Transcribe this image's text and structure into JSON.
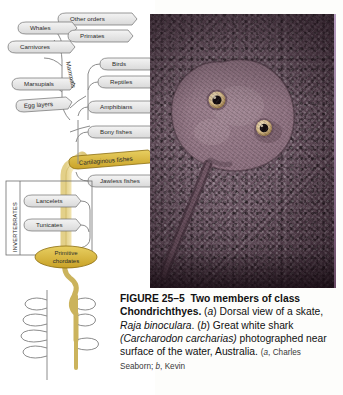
{
  "figure": {
    "number": "FIGURE 25–5",
    "title_bold": "Two members of class Chondrichthyes.",
    "part_a_marker": "a",
    "part_a_text_pre": ") Dorsal view of a skate, ",
    "part_a_species": "Raja binoculara",
    "part_a_text_post": ".",
    "part_b_marker": "b",
    "part_b_text_pre": ") Great white shark ",
    "part_b_species": "(Carcharodon carcharias)",
    "part_b_text_post": " photographed near surface of the water, Australia.",
    "credit_open": "(",
    "credit_a_marker": "a",
    "credit_a_name": ", Charles Seaborn; ",
    "credit_b_marker": "b",
    "credit_b_name": ", Kevin"
  },
  "photo": {
    "subject": "dorsal view of a skate resting on speckled seafloor",
    "alt": "Skate, Raja binoculara, dorsal view",
    "eye_count": 2,
    "background_color": "#6a5462",
    "body_color": "#7d6270",
    "tail_color": "#5a4450"
  },
  "cladogram": {
    "highlight_color": "#c9a227",
    "trunk_color": "#f2e3a4",
    "arrow_fill": "#e8e8e8",
    "arrow_stroke": "#6e6e6e",
    "invertebrates_label": "INVERTEBRATES",
    "mammals_label": "Mammals",
    "highlighted_taxon": "Cartilaginous fishes",
    "branches": [
      {
        "id": "other-orders",
        "label": "Other orders"
      },
      {
        "id": "whales",
        "label": "Whales"
      },
      {
        "id": "primates",
        "label": "Primates"
      },
      {
        "id": "carnivores",
        "label": "Carnivores"
      },
      {
        "id": "marsupials",
        "label": "Marsupials"
      },
      {
        "id": "egg-layers",
        "label": "Egg layers"
      },
      {
        "id": "birds",
        "label": "Birds"
      },
      {
        "id": "reptiles",
        "label": "Reptiles"
      },
      {
        "id": "amphibians",
        "label": "Amphibians"
      },
      {
        "id": "bony-fishes",
        "label": "Bony fishes"
      },
      {
        "id": "cartilaginous-fishes",
        "label": "Cartilaginous fishes"
      },
      {
        "id": "jawless-fishes",
        "label": "Jawless fishes"
      },
      {
        "id": "lancelets",
        "label": "Lancelets"
      },
      {
        "id": "tunicates",
        "label": "Tunicates"
      },
      {
        "id": "primitive-chordates",
        "label": "Primitive chordates"
      }
    ]
  }
}
